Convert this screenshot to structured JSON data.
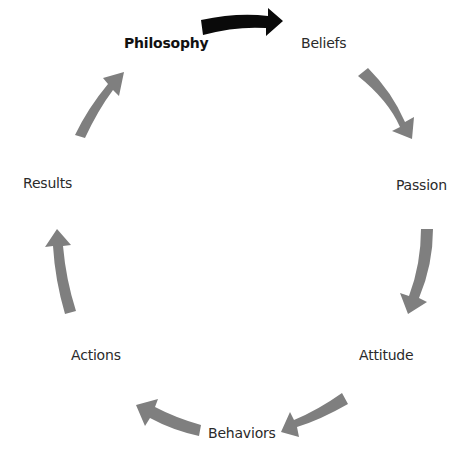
{
  "diagram": {
    "type": "cycle",
    "colors": {
      "background": "#ffffff",
      "highlight_arrow": "#0a0a0a",
      "cycle_arrow": "#7f7f7f",
      "label_text": "#2a2a2a",
      "highlight_text": "#111111"
    },
    "nodes": [
      {
        "id": "philosophy",
        "label": "Philosophy",
        "emphasized": true
      },
      {
        "id": "beliefs",
        "label": "Beliefs",
        "emphasized": false
      },
      {
        "id": "passion",
        "label": "Passion",
        "emphasized": false
      },
      {
        "id": "attitude",
        "label": "Attitude",
        "emphasized": false
      },
      {
        "id": "behaviors",
        "label": "Behaviors",
        "emphasized": false
      },
      {
        "id": "actions",
        "label": "Actions",
        "emphasized": false
      },
      {
        "id": "results",
        "label": "Results",
        "emphasized": false
      }
    ],
    "edges": [
      {
        "from": "philosophy",
        "to": "beliefs",
        "style": "highlight"
      },
      {
        "from": "beliefs",
        "to": "passion",
        "style": "normal"
      },
      {
        "from": "passion",
        "to": "attitude",
        "style": "normal"
      },
      {
        "from": "attitude",
        "to": "behaviors",
        "style": "normal"
      },
      {
        "from": "behaviors",
        "to": "actions",
        "style": "normal"
      },
      {
        "from": "actions",
        "to": "results",
        "style": "normal"
      },
      {
        "from": "results",
        "to": "philosophy",
        "style": "normal"
      }
    ]
  }
}
